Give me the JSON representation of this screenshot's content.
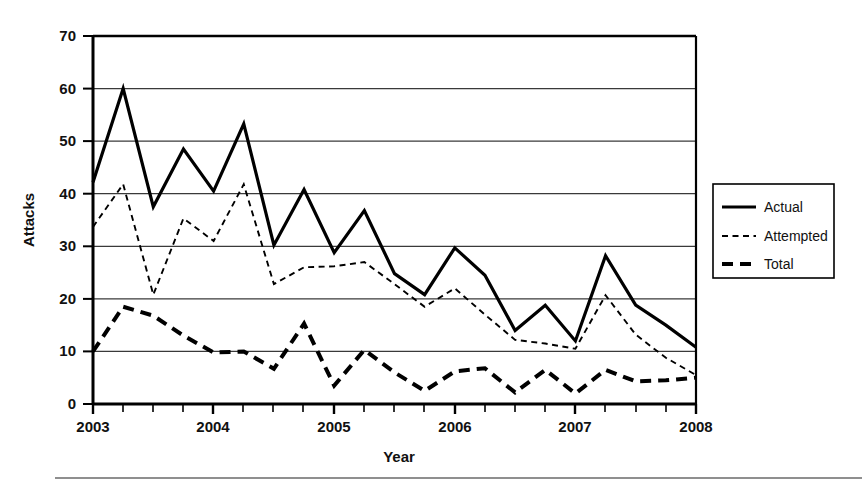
{
  "chart_data": {
    "type": "line",
    "title": "",
    "xlabel": "Year",
    "ylabel": "Attacks",
    "xlim": [
      2003,
      2008
    ],
    "ylim": [
      0,
      70
    ],
    "yticks": [
      0,
      10,
      20,
      30,
      40,
      50,
      60,
      70
    ],
    "xticks": [
      2003,
      2004,
      2005,
      2006,
      2007,
      2008
    ],
    "xtick_labels": [
      "2003",
      "2004",
      "2005",
      "2006",
      "2007",
      "2008"
    ],
    "ytick_labels": [
      "0",
      "10",
      "20",
      "30",
      "40",
      "50",
      "60",
      "70"
    ],
    "minor_xticks_per_major": 4,
    "grid": "horizontal",
    "legend_position": "right-outside",
    "x": [
      2003.0,
      2003.25,
      2003.5,
      2003.75,
      2004.0,
      2004.25,
      2004.5,
      2004.75,
      2005.0,
      2005.25,
      2005.5,
      2005.75,
      2006.0,
      2006.25,
      2006.5,
      2006.75,
      2007.0,
      2007.25,
      2007.5,
      2007.75,
      2008.0
    ],
    "series": [
      {
        "name": "Actual",
        "style": "solid",
        "color": "#000000",
        "values": [
          42.2,
          60.0,
          37.5,
          48.5,
          40.5,
          53.3,
          30.2,
          40.8,
          28.8,
          36.8,
          24.8,
          20.8,
          29.7,
          24.5,
          14.0,
          18.8,
          12.0,
          28.2,
          18.8,
          15.0,
          10.8
        ]
      },
      {
        "name": "Attempted",
        "style": "fine-dashed",
        "color": "#000000",
        "values": [
          33.7,
          41.8,
          20.8,
          35.3,
          31.0,
          41.8,
          22.8,
          26.0,
          26.2,
          27.0,
          22.8,
          18.5,
          22.0,
          17.0,
          12.2,
          11.5,
          10.5,
          20.7,
          13.2,
          8.8,
          5.5
        ]
      },
      {
        "name": "Total",
        "style": "thick-dashed",
        "color": "#000000",
        "values": [
          10.0,
          18.5,
          16.8,
          13.0,
          9.8,
          10.0,
          6.7,
          15.3,
          3.5,
          10.3,
          6.0,
          2.5,
          6.2,
          6.8,
          2.2,
          6.5,
          2.0,
          6.5,
          4.3,
          4.5,
          5.0
        ]
      }
    ]
  },
  "axes": {
    "y_axis_title": "Attacks",
    "x_axis_title": "Year",
    "y_tick_labels": [
      "70",
      "60",
      "50",
      "40",
      "30",
      "20",
      "10",
      "0"
    ],
    "x_tick_labels": [
      "2003",
      "2004",
      "2005",
      "2006",
      "2007",
      "2008"
    ]
  },
  "legend": {
    "items": [
      {
        "label": "Actual",
        "style": "solid"
      },
      {
        "label": "Attempted",
        "style": "fine-dashed"
      },
      {
        "label": "Total",
        "style": "thick-dashed"
      }
    ]
  },
  "colors": {
    "ink": "#000000",
    "grid": "#333333",
    "background": "#ffffff",
    "rule": "#555555"
  }
}
